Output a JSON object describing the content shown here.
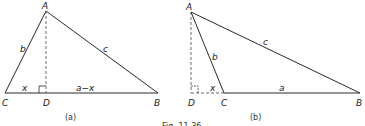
{
  "caption": "Fig. 11.36",
  "figures": [
    {
      "id": "a",
      "label": "(a)",
      "vertices": {
        "A": {
          "label": "A",
          "x": 46,
          "y": 11
        },
        "C": {
          "label": "C",
          "x": 5,
          "y": 93
        },
        "D": {
          "label": "D",
          "x": 46,
          "y": 93
        },
        "B": {
          "label": "B",
          "x": 158,
          "y": 93
        }
      },
      "sides": {
        "b": "b",
        "c": "c",
        "x": "x",
        "a_minus_x": "a−x"
      },
      "description": "Acute triangle ABC with altitude AD dropped onto CB; D lies between C and B; CD = x, DB = a−x"
    },
    {
      "id": "b",
      "label": "(b)",
      "vertices": {
        "A": {
          "label": "A",
          "x": 191,
          "y": 12
        },
        "D": {
          "label": "D",
          "x": 191,
          "y": 93
        },
        "C": {
          "label": "C",
          "x": 224,
          "y": 93
        },
        "B": {
          "label": "B",
          "x": 360,
          "y": 93
        }
      },
      "sides": {
        "b": "b",
        "c": "c",
        "x": "x",
        "a": "a"
      },
      "description": "Obtuse triangle ABC with altitude AD dropped onto BC extended; D lies outside segment CB; DC = x, CB = a"
    }
  ]
}
